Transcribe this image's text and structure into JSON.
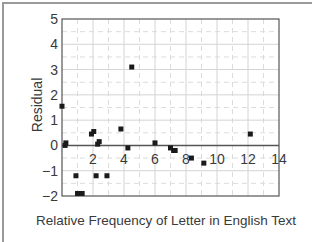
{
  "chart_data": {
    "type": "scatter",
    "title": "",
    "xlabel": "Relative Frequency of Letter in English Text",
    "ylabel": "Residual",
    "xlim": [
      0,
      14
    ],
    "ylim": [
      -2,
      5
    ],
    "xticks": [
      2,
      4,
      6,
      8,
      10,
      12,
      14
    ],
    "yticks": [
      5,
      4,
      3,
      2,
      1,
      0,
      -1,
      -2
    ],
    "ytick_labels": [
      "5",
      "4",
      "3",
      "2",
      "1",
      "0",
      "−1",
      "−2"
    ],
    "grid": true,
    "legend": null,
    "series": [
      {
        "name": "residuals",
        "points": [
          {
            "x": 0.0,
            "y": 1.55
          },
          {
            "x": 0.2,
            "y": 0.0
          },
          {
            "x": 0.25,
            "y": 0.1
          },
          {
            "x": 0.9,
            "y": -1.2
          },
          {
            "x": 1.0,
            "y": -1.9
          },
          {
            "x": 1.3,
            "y": -1.9
          },
          {
            "x": 1.9,
            "y": 0.45
          },
          {
            "x": 2.05,
            "y": 0.55
          },
          {
            "x": 2.2,
            "y": -1.2
          },
          {
            "x": 2.3,
            "y": 0.05
          },
          {
            "x": 2.4,
            "y": 0.15
          },
          {
            "x": 2.9,
            "y": -1.2
          },
          {
            "x": 3.8,
            "y": 0.65
          },
          {
            "x": 4.25,
            "y": -0.1
          },
          {
            "x": 4.5,
            "y": 3.1
          },
          {
            "x": 6.0,
            "y": 0.1
          },
          {
            "x": 7.0,
            "y": -0.1
          },
          {
            "x": 7.2,
            "y": -0.2
          },
          {
            "x": 7.3,
            "y": -0.2
          },
          {
            "x": 8.35,
            "y": -0.5
          },
          {
            "x": 9.15,
            "y": -0.7
          },
          {
            "x": 12.15,
            "y": 0.45
          }
        ]
      }
    ]
  },
  "colors": {
    "marker": "#1a1a1a",
    "axis": "#555555",
    "zero_line": "#555555",
    "grid_major": "#d4d4d4",
    "grid_minor": "#dcdcdc",
    "frame": "#9a9a9a",
    "text": "#3a3a3a"
  }
}
